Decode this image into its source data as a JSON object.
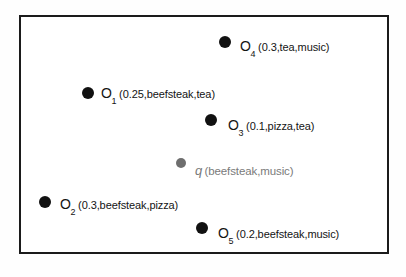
{
  "figure": {
    "background_color": "#ffffff",
    "frame_color": "#1b1b1b",
    "object_point_color": "#111111",
    "query_point_color": "#6e6e6e"
  },
  "chart_data": {
    "type": "scatter",
    "title": "",
    "xlabel": "",
    "ylabel": "",
    "grid": false,
    "legend": "none",
    "xlim": [
      0,
      406
    ],
    "ylim": [
      0,
      277
    ],
    "points": [
      {
        "id": "o4",
        "name": "O",
        "subscript": "4",
        "attributes": "(0.3,tea,music)",
        "x": 225,
        "y": 42,
        "radius": 6,
        "kind": "object",
        "color": "#111111",
        "label_x": 240,
        "label_y": 38
      },
      {
        "id": "o1",
        "name": "O",
        "subscript": "1",
        "attributes": "(0.25,beefsteak,tea)",
        "x": 88,
        "y": 93,
        "radius": 6,
        "kind": "object",
        "color": "#111111",
        "label_x": 101,
        "label_y": 85
      },
      {
        "id": "o3",
        "name": "O",
        "subscript": "3",
        "attributes": "(0.1,pizza,tea)",
        "x": 211,
        "y": 120,
        "radius": 6,
        "kind": "object",
        "color": "#111111",
        "label_x": 228,
        "label_y": 117
      },
      {
        "id": "q",
        "name": "q",
        "subscript": "",
        "attributes": "(beefsteak,music)",
        "x": 181,
        "y": 163,
        "radius": 5,
        "kind": "query",
        "color": "#6e6e6e",
        "label_x": 195,
        "label_y": 162
      },
      {
        "id": "o2",
        "name": "O",
        "subscript": "2",
        "attributes": "(0.3,beefsteak,pizza)",
        "x": 45,
        "y": 202,
        "radius": 6,
        "kind": "object",
        "color": "#111111",
        "label_x": 60,
        "label_y": 196
      },
      {
        "id": "o5",
        "name": "O",
        "subscript": "5",
        "attributes": "(0.2,beefsteak,music)",
        "x": 202,
        "y": 228,
        "radius": 6,
        "kind": "object",
        "color": "#111111",
        "label_x": 218,
        "label_y": 225
      }
    ]
  }
}
